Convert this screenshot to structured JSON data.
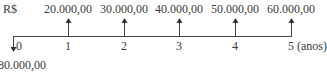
{
  "diagram": {
    "type": "cash-flow",
    "currency_label": "R$",
    "unit_label": "(anos)",
    "initial_outflow_label": "80.000,00",
    "periods": [
      {
        "t": "0",
        "x": 17,
        "value": null
      },
      {
        "t": "1",
        "x": 68,
        "value": "20.000,00"
      },
      {
        "t": "2",
        "x": 124,
        "value": "30.000,00"
      },
      {
        "t": "3",
        "x": 179,
        "value": "40.000,00"
      },
      {
        "t": "4",
        "x": 235,
        "value": "50.000,00"
      },
      {
        "t": "5",
        "x": 290,
        "value": "60.000,00"
      }
    ],
    "line_color": "#333333"
  }
}
